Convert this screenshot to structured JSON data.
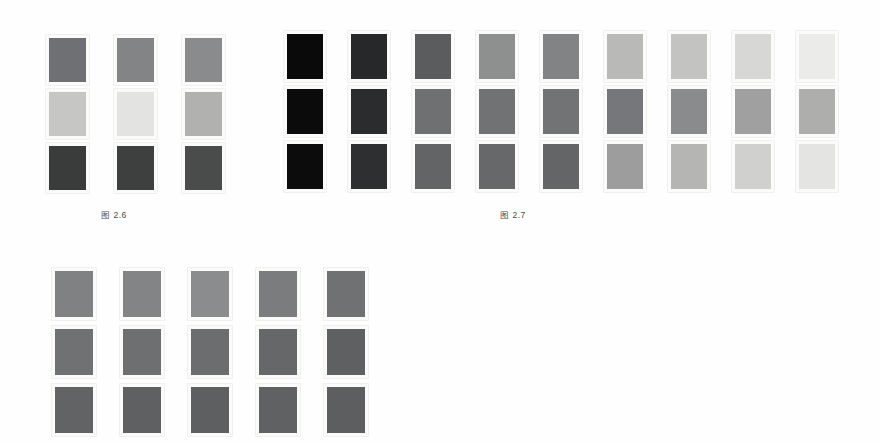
{
  "page": {
    "background_color": "#fefefe",
    "swatch_mount_color": "#fbfbfa"
  },
  "plates": [
    {
      "id": "plate-1",
      "name": "figure-2-6-swatch-plate",
      "caption": "图 2.6",
      "rows": 3,
      "columns": 3,
      "swatch_colors": [
        [
          "#6e7073",
          "#838486",
          "#8a8b8d"
        ],
        [
          "#c6c7c5",
          "#e3e4e2",
          "#b1b2b0"
        ],
        [
          "#3a3c3c",
          "#3e3f3f",
          "#4a4b4b"
        ]
      ]
    },
    {
      "id": "plate-2",
      "name": "figure-2-7-swatch-plate",
      "caption": "图 2.7",
      "rows": 3,
      "columns": 9,
      "swatch_colors": [
        [
          "#0a0a0a",
          "#272829",
          "#5a5c5d",
          "#8e8f8f",
          "#828384",
          "#b9bab7",
          "#c3c4c1",
          "#d7d8d5",
          "#ebebe9"
        ],
        [
          "#0b0b0b",
          "#2b2c2d",
          "#6e7072",
          "#717274",
          "#727375",
          "#76777a",
          "#8a8b8c",
          "#9fa09f",
          "#aeafad"
        ],
        [
          "#0c0c0c",
          "#2e2f30",
          "#626465",
          "#676869",
          "#636566",
          "#9c9d9c",
          "#b5b6b3",
          "#d0d1ce",
          "#e4e5e2"
        ]
      ]
    },
    {
      "id": "plate-3",
      "name": "unlabeled-swatch-plate",
      "caption": "",
      "rows": 3,
      "columns": 5,
      "swatch_colors": [
        [
          "#808183",
          "#838486",
          "#8b8c8d",
          "#7b7c7e",
          "#6f7173"
        ],
        [
          "#707173",
          "#6e6f71",
          "#6c6d6f",
          "#666769",
          "#5f6062"
        ],
        [
          "#626365",
          "#5f6062",
          "#5e5f61",
          "#606163",
          "#5d5e60"
        ]
      ]
    }
  ],
  "captions": {
    "figure_2_6": "图 2.6",
    "figure_2_7": "图 2.7"
  },
  "chart_data": {
    "type": "heatmap",
    "title": "",
    "subtitle": "",
    "xlabel": "",
    "ylabel": "",
    "grid": false,
    "legend_position": "none",
    "annotations": [
      "图 2.6",
      "图 2.7"
    ],
    "panels": [
      {
        "name": "图 2.6",
        "rows": 3,
        "columns": 3,
        "unit": "grayscale lightness (0-255)",
        "values": [
          [
            110,
            131,
            138
          ],
          [
            198,
            227,
            177
          ],
          [
            58,
            62,
            74
          ]
        ],
        "hex": [
          [
            "#6e7073",
            "#838486",
            "#8a8b8d"
          ],
          [
            "#c6c7c5",
            "#e3e4e2",
            "#b1b2b0"
          ],
          [
            "#3a3c3c",
            "#3e3f3f",
            "#4a4b4b"
          ]
        ]
      },
      {
        "name": "图 2.7",
        "rows": 3,
        "columns": 9,
        "unit": "grayscale lightness (0-255)",
        "values": [
          [
            10,
            39,
            90,
            142,
            130,
            185,
            195,
            215,
            235
          ],
          [
            11,
            43,
            110,
            113,
            114,
            118,
            138,
            159,
            174
          ],
          [
            12,
            46,
            98,
            103,
            99,
            156,
            181,
            208,
            228
          ]
        ],
        "hex": [
          [
            "#0a0a0a",
            "#272829",
            "#5a5c5d",
            "#8e8f8f",
            "#828384",
            "#b9bab7",
            "#c3c4c1",
            "#d7d8d5",
            "#ebebe9"
          ],
          [
            "#0b0b0b",
            "#2b2c2d",
            "#6e7072",
            "#717274",
            "#727375",
            "#76777a",
            "#8a8b8c",
            "#9fa09f",
            "#aeafad"
          ],
          [
            "#0c0c0c",
            "#2e2f30",
            "#626465",
            "#676869",
            "#636566",
            "#9c9d9c",
            "#b5b6b3",
            "#d0d1ce",
            "#e4e5e2"
          ]
        ]
      },
      {
        "name": "unlabeled",
        "rows": 3,
        "columns": 5,
        "unit": "grayscale lightness (0-255)",
        "values": [
          [
            128,
            131,
            139,
            123,
            111
          ],
          [
            112,
            110,
            108,
            102,
            95
          ],
          [
            98,
            95,
            94,
            96,
            93
          ]
        ],
        "hex": [
          [
            "#808183",
            "#838486",
            "#8b8c8d",
            "#7b7c7e",
            "#6f7173"
          ],
          [
            "#707173",
            "#6e6f71",
            "#6c6d6f",
            "#666769",
            "#5f6062"
          ],
          [
            "#626365",
            "#5f6062",
            "#5e5f61",
            "#606163",
            "#5d5e60"
          ]
        ]
      }
    ]
  }
}
